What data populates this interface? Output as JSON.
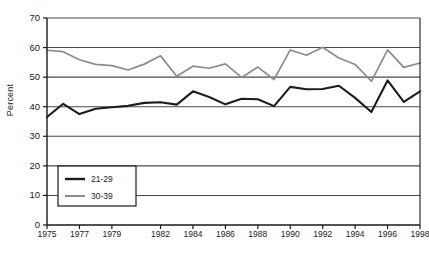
{
  "chart_data": {
    "type": "line",
    "title": "",
    "xlabel": "",
    "ylabel": "Percent",
    "ylim": [
      0,
      70
    ],
    "ytick_values": [
      0,
      10,
      20,
      30,
      40,
      50,
      60,
      70
    ],
    "grid": true,
    "legend_position": "inside-lower-left",
    "x": [
      1975,
      1976,
      1977,
      1978,
      1979,
      1980,
      1981,
      1982,
      1983,
      1984,
      1985,
      1986,
      1987,
      1988,
      1989,
      1990,
      1991,
      1992,
      1993,
      1994,
      1995,
      1996,
      1997,
      1998
    ],
    "xtick_labels": [
      "1975",
      "1977",
      "1979",
      "1982",
      "1984",
      "1986",
      "1988",
      "1990",
      "1992",
      "1994",
      "1996",
      "1998"
    ],
    "xtick_x": [
      1975,
      1977,
      1979,
      1982,
      1984,
      1986,
      1988,
      1990,
      1992,
      1994,
      1996,
      1998
    ],
    "series": [
      {
        "name": "21-29",
        "color": "#1c1c1c",
        "values": [
          36.5,
          41.0,
          37.5,
          39.3,
          39.8,
          40.3,
          41.3,
          41.5,
          40.7,
          45.2,
          43.3,
          40.8,
          42.7,
          42.5,
          40.2,
          46.7,
          45.9,
          46.0,
          47.1,
          43.0,
          38.2,
          48.9,
          41.6,
          45.2
        ]
      },
      {
        "name": "30-39",
        "color": "#8c8c8c",
        "values": [
          59.1,
          58.6,
          55.9,
          54.3,
          53.9,
          52.4,
          54.4,
          57.2,
          50.3,
          53.7,
          53.0,
          54.5,
          49.9,
          53.4,
          49.2,
          59.2,
          57.4,
          60.1,
          56.5,
          54.3,
          48.6,
          59.2,
          53.3,
          54.8
        ]
      }
    ],
    "legend": [
      {
        "label": "21-29",
        "color": "#1c1c1c"
      },
      {
        "label": "30-39",
        "color": "#8c8c8c"
      }
    ]
  },
  "caption": ""
}
